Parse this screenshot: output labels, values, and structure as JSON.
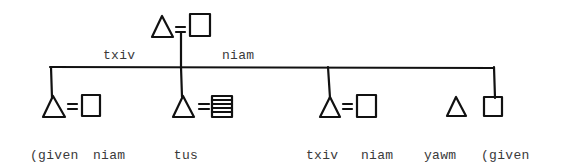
{
  "diagram": {
    "type": "kinship",
    "colors": {
      "line": "#111111",
      "text": "#3a3a3a",
      "background": "#ffffff"
    },
    "parents": {
      "father": {
        "symbol": "triangle",
        "label": "txiv"
      },
      "mother": {
        "symbol": "square",
        "label": "niam"
      },
      "relation": "married"
    },
    "children": [
      {
        "symbol": "triangle",
        "label_lines": [
          "(given",
          "name)"
        ],
        "spouse": {
          "symbol": "square",
          "label_lines": [
            "niam",
            "ntxawm"
          ]
        }
      },
      {
        "symbol": "triangle",
        "label_lines": [
          "tus",
          "txiv"
        ],
        "spouse": {
          "symbol": "square-striped",
          "label_lines": []
        }
      },
      {
        "symbol": "triangle",
        "label_lines": [
          "txiv",
          "laus"
        ],
        "spouse": {
          "symbol": "square",
          "label_lines": [
            "niam",
            "laus"
          ]
        }
      },
      {
        "symbol": "triangle",
        "label_lines": [
          "yawm",
          "vauv"
        ],
        "connected": false
      },
      {
        "symbol": "square",
        "label_lines": [
          "(given",
          "name)"
        ]
      }
    ]
  }
}
